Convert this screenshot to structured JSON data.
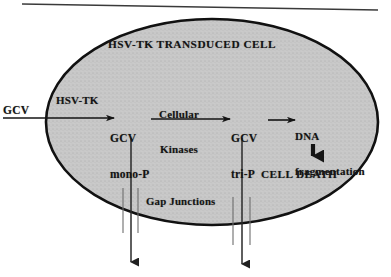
{
  "figure": {
    "type": "biological-pathway-diagram",
    "cell": {
      "title": "HSV-TK TRANSDUCED CELL",
      "fill_color": "#c9c9c9",
      "border_color": "#111111"
    },
    "labels": {
      "gcv_input": "GCV",
      "hsv_tk_enzyme": "HSV-TK",
      "gcv_mono": "GCV\nmono-P",
      "gcv_mono_line1": "GCV",
      "gcv_mono_line2": "mono-P",
      "cellular_kinases": "Cellular\nKinases",
      "cellular_kinases_line1": "Cellular",
      "cellular_kinases_line2": "Kinases",
      "gcv_tri": "GCV\ntri-P",
      "gcv_tri_line1": "GCV",
      "gcv_tri_line2": "tri-P",
      "dna_fragmentation": "DNA\nfragmentation",
      "dna_frag_line1": "DNA",
      "dna_frag_line2": "fragmentation",
      "cell_death": "CELL DEATH",
      "gap_junctions": "Gap Junctions"
    },
    "flow_steps": [
      "GCV",
      "GCV mono-P",
      "GCV tri-P",
      "DNA fragmentation",
      "CELL DEATH"
    ],
    "arrows": {
      "uptake": "GCV enters cell, converted by HSV-TK",
      "phosphorylation": "GCV mono-P to GCV tri-P via Cellular Kinases",
      "damage": "GCV tri-P causes DNA fragmentation",
      "death": "DNA fragmentation leads to CELL DEATH",
      "bystander_left": "GCV mono-P exits through gap junctions",
      "bystander_right": "GCV tri-P exits through gap junctions"
    },
    "artifact": {
      "scan_line": "slanted horizontal scan line across top of image"
    }
  }
}
